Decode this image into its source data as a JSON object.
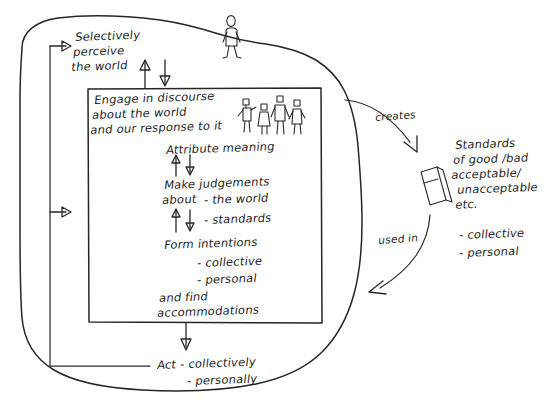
{
  "diagram": {
    "ink_color": "#262626",
    "background_color": "#ffffff",
    "outer_boundary_name": "person-boundary-blob",
    "inner_box_name": "discourse-box"
  },
  "labels": {
    "selectively_perceive": "Selectively\nperceive\nthe world",
    "engage_in_discourse": "Engage in discourse\nabout the world\nand our response to it",
    "attribute_meaning": "Attribute meaning",
    "make_judgements": "Make judgements\nabout",
    "judgement_item_1": "- the world",
    "judgement_item_2": "- standards",
    "form_intentions": "Form intentions",
    "intention_item_1": "- collective",
    "intention_item_2": "- personal",
    "and_find": "and find\naccommodations",
    "act": "Act - collectively",
    "act_item_2": "- personally",
    "creates": "creates",
    "used_in": "used in",
    "standards_block": "Standards\nof good /bad\nacceptable/\n  unacceptable\n  etc.",
    "standards_item_1": "- collective",
    "standards_item_2": "- personal"
  },
  "icons": {
    "lone_figure": "standing-person-figure",
    "group_figures": "group-of-people-figures",
    "book_slab": "tilted-book-icon",
    "arrow_up": "arrow-up-icon",
    "arrow_down": "arrow-down-icon",
    "arrow_right": "arrow-right-icon"
  },
  "flow": {
    "creates_from": "Engage in discourse",
    "creates_to": "Standards",
    "used_in_from": "Standards",
    "used_in_to": "Act"
  }
}
